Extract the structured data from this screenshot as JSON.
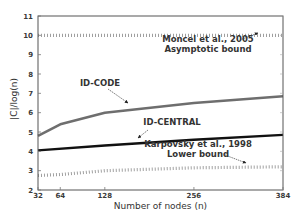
{
  "chart_data": {
    "type": "line",
    "title": "",
    "xlabel": "Number of nodes (n)",
    "ylabel": "|C|/log(n)",
    "xlim": [
      32,
      384
    ],
    "ylim": [
      2,
      11
    ],
    "xticks": [
      32,
      64,
      128,
      256,
      384
    ],
    "yticks": [
      2,
      3,
      4,
      5,
      6,
      7,
      8,
      9,
      10,
      11
    ],
    "grid": false,
    "legend": "none (inline annotations)",
    "series": [
      {
        "name": "ID-CODE",
        "style": "solid",
        "color": "#6e6e6e",
        "x": [
          32,
          64,
          128,
          256,
          384
        ],
        "y": [
          4.8,
          5.4,
          6.0,
          6.5,
          6.85
        ]
      },
      {
        "name": "ID-CENTRAL",
        "style": "solid",
        "color": "#111111",
        "x": [
          32,
          128,
          256,
          384
        ],
        "y": [
          4.05,
          4.3,
          4.6,
          4.85
        ]
      },
      {
        "name": "Moncel et al., 2005 Asymptotic bound",
        "style": "dotted",
        "color": "#888888",
        "x": [
          32,
          128,
          256,
          384
        ],
        "y": [
          10.0,
          10.0,
          10.0,
          10.0
        ]
      },
      {
        "name": "Karpovsky et al., 1998 Lower bound",
        "style": "dotted",
        "color": "#888888",
        "x": [
          32,
          64,
          128,
          256,
          384
        ],
        "y": [
          2.75,
          2.8,
          3.0,
          3.15,
          3.2
        ]
      }
    ],
    "annotations": [
      {
        "id": "moncel",
        "lines": [
          "Moncel et al., 2005",
          "Asymptotic bound"
        ],
        "points_to": "Moncel et al., 2005 Asymptotic bound"
      },
      {
        "id": "idcode",
        "lines": [
          "ID-CODE"
        ],
        "points_to": "ID-CODE"
      },
      {
        "id": "idcentral",
        "lines": [
          "ID-CENTRAL"
        ],
        "points_to": "ID-CENTRAL"
      },
      {
        "id": "karpovsky",
        "lines": [
          "Karpovsky et al., 1998",
          "Lower bound"
        ],
        "points_to": "Karpovsky et al., 1998 Lower bound"
      }
    ]
  }
}
